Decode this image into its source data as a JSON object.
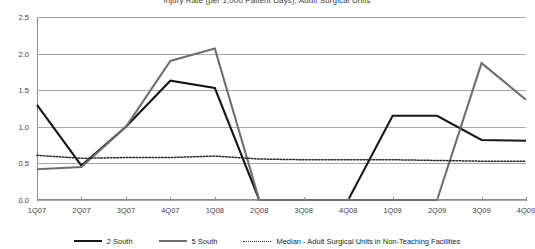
{
  "chart_data": {
    "type": "line",
    "title": "Injury Rate (per 1,000 Patient Days), Adult Surgical Units",
    "xlabel": "",
    "ylabel": "",
    "ylim": [
      0.0,
      2.5
    ],
    "ytick_labels": [
      "0.0",
      "0.5",
      "1.0",
      "1.5",
      "2.0",
      "2.5"
    ],
    "ytick_values": [
      0.0,
      0.5,
      1.0,
      1.5,
      2.0,
      2.5
    ],
    "grid": true,
    "legend_position": "bottom",
    "categories": [
      "1Q07",
      "2Q07",
      "3Q07",
      "4Q07",
      "1Q08",
      "2Q08",
      "3Q08",
      "4Q08",
      "1Q09",
      "2Q09",
      "3Q09",
      "4Q09"
    ],
    "series": [
      {
        "name": "2 South",
        "color": "#161616",
        "style": "solid",
        "values": [
          1.3,
          0.47,
          1.0,
          1.63,
          1.53,
          0.0,
          0.0,
          0.0,
          1.15,
          1.15,
          0.82,
          0.81
        ]
      },
      {
        "name": "5 South",
        "color": "#6e6e6e",
        "style": "solid",
        "values": [
          0.42,
          0.45,
          1.0,
          1.9,
          2.07,
          0.0,
          0.0,
          0.0,
          0.0,
          0.0,
          1.87,
          1.37
        ]
      },
      {
        "name": "Median - Adult Surgical Units in Non-Teaching Facilities",
        "color": "#2b2b2b",
        "style": "dotted",
        "values": [
          0.61,
          0.57,
          0.58,
          0.58,
          0.6,
          0.56,
          0.55,
          0.55,
          0.55,
          0.54,
          0.53,
          0.53
        ]
      }
    ]
  },
  "legend": {
    "items": [
      {
        "label": "2 South",
        "swatch": "solid-dark"
      },
      {
        "label": "5 South",
        "swatch": "solid-gray"
      },
      {
        "label": "Median - Adult Surgical Units in Non-Teaching Facilities",
        "swatch": "dotted"
      }
    ]
  },
  "colors": {
    "series_dark": "#161616",
    "series_gray": "#6e6e6e",
    "median": "#2b2b2b",
    "gridline": "#a6a6a6",
    "axis": "#8c8c8c",
    "background": "#ffffff",
    "text": "#3f3f3f"
  }
}
